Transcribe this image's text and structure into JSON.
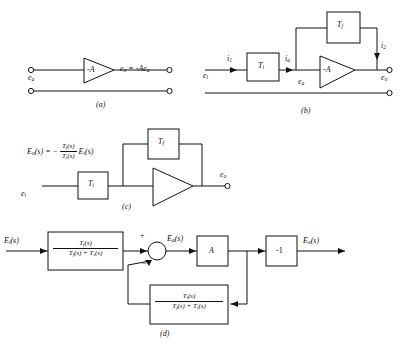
{
  "page": {
    "background": "#ffffff",
    "line_color": "#111111"
  },
  "figures": [
    {
      "id": "a",
      "caption": "(a)",
      "labels": {
        "input": "e",
        "input_sub": "a",
        "amp": "-A",
        "output_eq": "e",
        "output_eq_sub": "o",
        "output_expr": "= -Ae",
        "output_expr_sub": "a"
      }
    },
    {
      "id": "b",
      "caption": "(b)",
      "labels": {
        "e_in": "e",
        "e_in_sub": "i",
        "i1": "i",
        "i1_sub": "1",
        "ti": "T",
        "ti_sub": "i",
        "ia": "i",
        "ia_sub": "a",
        "tf": "T",
        "tf_sub": "f",
        "i2": "i",
        "i2_sub": "2",
        "ea": "e",
        "ea_sub": "a",
        "amp": "-A",
        "eo": "e",
        "eo_sub": "o"
      }
    },
    {
      "id": "c",
      "caption": "(c)",
      "equation": {
        "lhs": "E",
        "lhs_sub": "o",
        "lhs_arg": "(s) = −",
        "frac_num": "T",
        "frac_num_sub": "f",
        "frac_num_arg": "(s)",
        "frac_den": "T",
        "frac_den_sub": "i",
        "frac_den_arg": "(s)",
        "rhs": "E",
        "rhs_sub": "i",
        "rhs_arg": "(s)"
      },
      "labels": {
        "e_in": "e",
        "e_in_sub": "i",
        "ti": "T",
        "ti_sub": "i",
        "tf": "T",
        "tf_sub": "f",
        "eo": "e",
        "eo_sub": "o"
      }
    },
    {
      "id": "d",
      "caption": "(d)",
      "labels": {
        "input": "E",
        "input_sub": "i",
        "input_arg": "(s)",
        "forward_num": "T",
        "forward_num_sub": "f",
        "forward_num_arg": "(s)",
        "forward_den_a": "T",
        "forward_den_a_sub": "f",
        "forward_den_a_arg": "(s) + ",
        "forward_den_b": "T",
        "forward_den_b_sub": "i",
        "forward_den_b_arg": "(s)",
        "sum_plus": "+",
        "sum_minus": "−",
        "ea": "E",
        "ea_sub": "a",
        "ea_arg": "(s)",
        "gain_a": "A",
        "gain_neg1": "-1",
        "output": "E",
        "output_sub": "o",
        "output_arg": "(s)",
        "feedback_num": "T",
        "feedback_num_sub": "i",
        "feedback_num_arg": "(s)",
        "feedback_den_a": "T",
        "feedback_den_a_sub": "f",
        "feedback_den_a_arg": "(s) + ",
        "feedback_den_b": "T",
        "feedback_den_b_sub": "i",
        "feedback_den_b_arg": "(s)"
      }
    }
  ]
}
